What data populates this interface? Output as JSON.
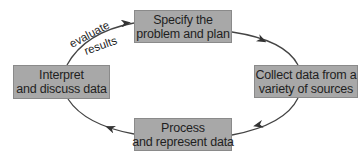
{
  "diagram": {
    "type": "cycle",
    "colors": {
      "box_fill": "#a8a8a8",
      "box_border": "#8a8a8a",
      "text": "#1f1f1f",
      "arrow": "#333333"
    },
    "nodes": [
      {
        "id": "specify",
        "line1": "Specify the",
        "line2": "problem and plan"
      },
      {
        "id": "collect",
        "line1": "Collect data from a",
        "line2": "variety of sources"
      },
      {
        "id": "process",
        "line1": "Process",
        "line2": "and represent data"
      },
      {
        "id": "interpret",
        "line1": "Interpret",
        "line2": "and discuss data"
      }
    ],
    "edges": [
      {
        "from": "specify",
        "to": "collect"
      },
      {
        "from": "collect",
        "to": "process"
      },
      {
        "from": "process",
        "to": "interpret"
      },
      {
        "from": "interpret",
        "to": "specify",
        "label_line1": "evaluate",
        "label_line2": "results"
      }
    ]
  }
}
